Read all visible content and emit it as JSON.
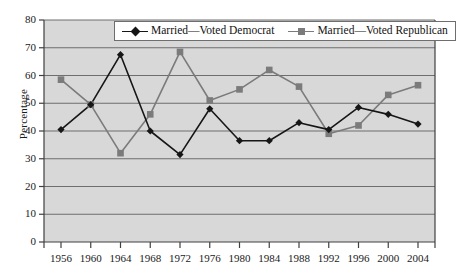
{
  "chart_data": {
    "type": "line",
    "title": "",
    "subtitle": "",
    "xlabel": "",
    "ylabel": "Percentage",
    "categories": [
      "1956",
      "1960",
      "1964",
      "1968",
      "1972",
      "1976",
      "1980",
      "1984",
      "1988",
      "1992",
      "1996",
      "2000",
      "2004"
    ],
    "series": [
      {
        "name": "Married—Voted Democrat",
        "marker": "diamond",
        "color": "#161616",
        "values": [
          40.5,
          49.5,
          67.5,
          40.0,
          31.5,
          48.0,
          36.5,
          36.5,
          43.0,
          40.5,
          48.5,
          46.0,
          42.5
        ]
      },
      {
        "name": "Married—Voted Republican",
        "marker": "square",
        "color": "#7b7b7b",
        "values": [
          58.5,
          49.5,
          32.0,
          46.0,
          68.5,
          51.0,
          55.0,
          62.0,
          56.0,
          39.0,
          42.0,
          53.0,
          56.5
        ]
      }
    ],
    "ylim": [
      0,
      80
    ],
    "yticks": [
      0,
      10,
      20,
      30,
      40,
      50,
      60,
      70,
      80
    ],
    "grid": true,
    "grid_axis": "y",
    "legend_position": "top-center",
    "plot_background": "#d8d8d8",
    "grid_color": "#6e6e6e",
    "axis_color": "#404040"
  },
  "legend": {
    "entries": [
      {
        "label": "Married—Voted Democrat",
        "marker": "diamond-icon"
      },
      {
        "label": "Married—Voted Republican",
        "marker": "square-icon"
      }
    ]
  }
}
